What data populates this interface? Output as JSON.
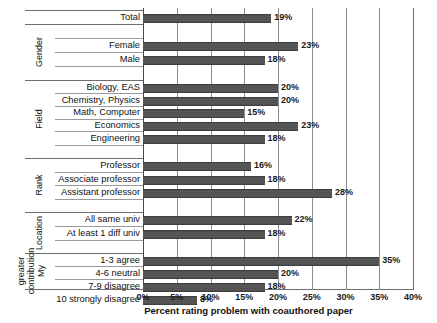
{
  "chart_data": {
    "type": "bar",
    "orientation": "horizontal",
    "title": "",
    "xlabel": "Percent rating problem with coauthored paper",
    "ylabel": "",
    "xlim": [
      0,
      40
    ],
    "xticks": [
      "0%",
      "5%",
      "10%",
      "15%",
      "20%",
      "25%",
      "30%",
      "35%",
      "40%"
    ],
    "xtick_values": [
      0,
      5,
      10,
      15,
      20,
      25,
      30,
      35,
      40
    ],
    "grid": true,
    "legend": "none",
    "bar_color": "#525252",
    "categories": [
      "Total",
      "Female",
      "Male",
      "Biology, EAS",
      "Chemistry, Physics",
      "Math, Computer",
      "Economics",
      "Engineering",
      "Professor",
      "Associate professor",
      "Assistant professor",
      "All same univ",
      "At least 1 diff univ",
      "1-3 agree",
      "4-6 neutral",
      "7-9 disagree",
      "10 strongly disagree"
    ],
    "values": [
      19,
      23,
      18,
      20,
      20,
      15,
      23,
      18,
      16,
      18,
      28,
      22,
      18,
      35,
      20,
      18,
      8
    ],
    "value_labels": [
      "19%",
      "23%",
      "18%",
      "20%",
      "20%",
      "15%",
      "23%",
      "18%",
      "16%",
      "18%",
      "28%",
      "22%",
      "18%",
      "35%",
      "20%",
      "18%",
      "8%"
    ],
    "groups": [
      {
        "label": "",
        "lines": [
          ""
        ],
        "categories": [
          "Total"
        ]
      },
      {
        "label": "Gender",
        "lines": [
          "Gender"
        ],
        "categories": [
          "Female",
          "Male"
        ]
      },
      {
        "label": "Field",
        "lines": [
          "Field"
        ],
        "categories": [
          "Biology, EAS",
          "Chemistry, Physics",
          "Math, Computer",
          "Economics",
          "Engineering"
        ]
      },
      {
        "label": "Rank",
        "lines": [
          "Rank"
        ],
        "categories": [
          "Professor",
          "Associate professor",
          "Assistant professor"
        ]
      },
      {
        "label": "Location",
        "lines": [
          "Location"
        ],
        "categories": [
          "All same univ",
          "At least 1 diff univ"
        ]
      },
      {
        "label": "My contribution greater",
        "lines": [
          "My",
          "contribution",
          "greater"
        ],
        "categories": [
          "1-3 agree",
          "4-6 neutral",
          "7-9 disagree",
          "10 strongly disagree"
        ]
      }
    ]
  },
  "rows": [
    {
      "label": "Total",
      "value": 19,
      "value_label": "19%",
      "y": 17,
      "group": ""
    },
    {
      "label": "Female",
      "value": 23,
      "value_label": "23%",
      "y": 45,
      "group": "Gender"
    },
    {
      "label": "Male",
      "value": 18,
      "value_label": "18%",
      "y": 59,
      "group": "Gender"
    },
    {
      "label": "Biology, EAS",
      "value": 20,
      "value_label": "20%",
      "y": 87,
      "group": "Field"
    },
    {
      "label": "Chemistry, Physics",
      "value": 20,
      "value_label": "20%",
      "y": 100,
      "group": "Field"
    },
    {
      "label": "Math, Computer",
      "value": 15,
      "value_label": "15%",
      "y": 112,
      "group": "Field"
    },
    {
      "label": "Economics",
      "value": 23,
      "value_label": "23%",
      "y": 125,
      "group": "Field"
    },
    {
      "label": "Engineering",
      "value": 18,
      "value_label": "18%",
      "y": 138,
      "group": "Field"
    },
    {
      "label": "Professor",
      "value": 16,
      "value_label": "16%",
      "y": 165,
      "group": "Rank"
    },
    {
      "label": "Associate professor",
      "value": 18,
      "value_label": "18%",
      "y": 179,
      "group": "Rank"
    },
    {
      "label": "Assistant professor",
      "value": 28,
      "value_label": "28%",
      "y": 192,
      "group": "Rank"
    },
    {
      "label": "All same univ",
      "value": 22,
      "value_label": "22%",
      "y": 219,
      "group": "Location"
    },
    {
      "label": "At least 1 diff univ",
      "value": 18,
      "value_label": "18%",
      "y": 233,
      "group": "Location"
    },
    {
      "label": "1-3 agree",
      "value": 35,
      "value_label": "35%",
      "y": 260,
      "group": "My contribution greater"
    },
    {
      "label": "4-6 neutral",
      "value": 20,
      "value_label": "20%",
      "y": 273,
      "group": "My contribution greater"
    },
    {
      "label": "7-9 disagree",
      "value": 18,
      "value_label": "18%",
      "y": 286,
      "group": "My contribution greater"
    },
    {
      "label": "10 strongly disagree",
      "value": 8,
      "value_label": "8%",
      "y": 299,
      "group": "My contribution greater"
    }
  ],
  "axis": {
    "title": "Percent rating problem with coauthored paper",
    "ticks": [
      "0%",
      "5%",
      "10%",
      "15%",
      "20%",
      "25%",
      "30%",
      "35%",
      "40%"
    ]
  },
  "group_labels": [
    {
      "name": "Gender",
      "lines": [
        "Gender"
      ]
    },
    {
      "name": "Field",
      "lines": [
        "Field"
      ]
    },
    {
      "name": "Rank",
      "lines": [
        "Rank"
      ]
    },
    {
      "name": "Location",
      "lines": [
        "Location"
      ]
    },
    {
      "name": "MyContribution",
      "lines": [
        "My",
        "contribution",
        "greater"
      ]
    }
  ]
}
